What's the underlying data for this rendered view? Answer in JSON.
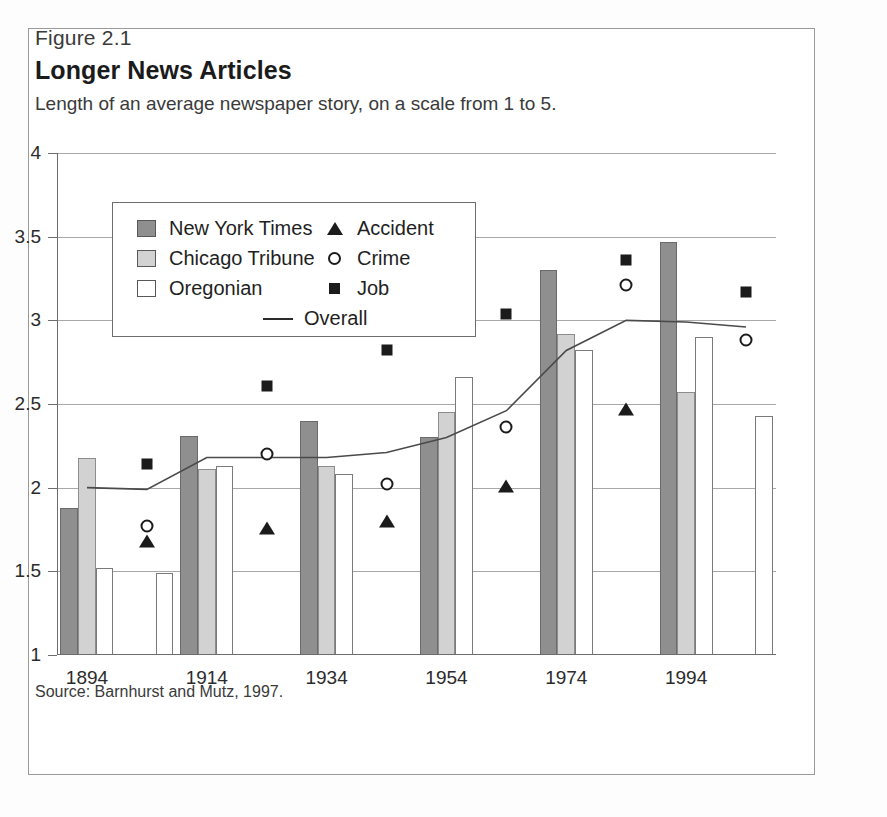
{
  "figure": {
    "number": "Figure 2.1",
    "title": "Longer News Articles",
    "subtitle": "Length of an average newspaper story, on a scale from 1 to 5.",
    "source": "Source: Barnhurst and Mutz, 1997."
  },
  "legend": {
    "series": [
      {
        "label": "New York Times",
        "swatch": "dark-gray-square",
        "color": "#8f8f8f"
      },
      {
        "label": "Chicago Tribune",
        "swatch": "light-gray-square",
        "color": "#d2d2d2"
      },
      {
        "label": "Oregonian",
        "swatch": "white-square",
        "color": "#ffffff"
      }
    ],
    "markers": [
      {
        "label": "Accident",
        "glyph": "filled-triangle"
      },
      {
        "label": "Crime",
        "glyph": "open-circle"
      },
      {
        "label": "Job",
        "glyph": "filled-square"
      }
    ],
    "line": {
      "label": "Overall",
      "glyph": "solid-line"
    }
  },
  "chart_data": {
    "type": "bar",
    "title": "Longer News Articles",
    "subtitle": "Length of an average newspaper story, on a scale from 1 to 5.",
    "xlabel": "",
    "ylabel": "",
    "ylim": [
      1,
      4
    ],
    "yticks": [
      1,
      1.5,
      2,
      2.5,
      3,
      3.5,
      4
    ],
    "ytick_labels": [
      "1",
      "1.5",
      "2",
      "2.5",
      "3",
      "3.5",
      "4"
    ],
    "grid": true,
    "legend_position": "upper-left-inset",
    "categories": [
      "1894",
      "1904",
      "1914",
      "1924",
      "1934",
      "1944",
      "1954",
      "1964",
      "1974",
      "1984",
      "1994",
      "2004"
    ],
    "xtick_labels_shown": [
      "1894",
      "1914",
      "1934",
      "1954",
      "1974",
      "1994"
    ],
    "series": [
      {
        "name": "New York Times",
        "values": [
          1.88,
          null,
          2.31,
          null,
          2.4,
          null,
          2.3,
          null,
          3.3,
          null,
          3.47,
          null
        ]
      },
      {
        "name": "Chicago Tribune",
        "values": [
          2.18,
          null,
          2.11,
          null,
          2.13,
          null,
          2.45,
          null,
          2.92,
          null,
          2.57,
          null
        ]
      },
      {
        "name": "Oregonian",
        "values": [
          1.52,
          1.49,
          2.13,
          null,
          2.08,
          null,
          2.66,
          null,
          2.82,
          null,
          2.9,
          2.43
        ]
      }
    ],
    "overlay_markers": [
      {
        "name": "Job",
        "x": "1904",
        "y": 2.14
      },
      {
        "name": "Crime",
        "x": "1904",
        "y": 1.77
      },
      {
        "name": "Accident",
        "x": "1904",
        "y": 1.68
      },
      {
        "name": "Job",
        "x": "1924",
        "y": 2.61
      },
      {
        "name": "Crime",
        "x": "1924",
        "y": 2.2
      },
      {
        "name": "Accident",
        "x": "1924",
        "y": 1.76
      },
      {
        "name": "Job",
        "x": "1944",
        "y": 2.82
      },
      {
        "name": "Crime",
        "x": "1944",
        "y": 2.02
      },
      {
        "name": "Accident",
        "x": "1944",
        "y": 1.8
      },
      {
        "name": "Job",
        "x": "1964",
        "y": 3.04
      },
      {
        "name": "Crime",
        "x": "1964",
        "y": 2.36
      },
      {
        "name": "Accident",
        "x": "1964",
        "y": 2.01
      },
      {
        "name": "Job",
        "x": "1984",
        "y": 3.36
      },
      {
        "name": "Crime",
        "x": "1984",
        "y": 3.21
      },
      {
        "name": "Accident",
        "x": "1984",
        "y": 2.47
      },
      {
        "name": "Job",
        "x": "2004",
        "y": 3.17
      },
      {
        "name": "Crime",
        "x": "2004",
        "y": 2.88
      }
    ],
    "overall_line": {
      "name": "Overall",
      "x": [
        "1894",
        "1904",
        "1914",
        "1924",
        "1934",
        "1944",
        "1954",
        "1964",
        "1974",
        "1984",
        "1994",
        "2004"
      ],
      "values": [
        2.0,
        1.99,
        2.18,
        2.18,
        2.18,
        2.21,
        2.3,
        2.46,
        2.82,
        3.0,
        2.99,
        2.96
      ]
    }
  }
}
